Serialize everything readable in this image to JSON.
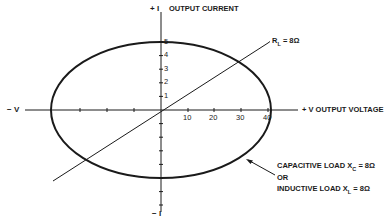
{
  "diagram": {
    "type": "load-line-ellipse",
    "colors": {
      "ink": "#1a1a1a",
      "background": "#ffffff"
    },
    "axes": {
      "y_top_label": "+ I",
      "y_bottom_label": "− I",
      "y_title": "OUTPUT CURRENT",
      "x_left_label": "− V",
      "x_right_label": "+ V",
      "x_title": "OUTPUT VOLTAGE",
      "y_ticks": [
        "1",
        "2",
        "3",
        "4",
        "5"
      ],
      "x_ticks": [
        "10",
        "20",
        "30",
        "40"
      ]
    },
    "resistive_line": {
      "label_main": "R",
      "label_sub": "L",
      "label_value": "= 8Ω"
    },
    "ellipse_annotation": {
      "line1_main": "CAPACITIVE LOAD X",
      "line1_sub": "C",
      "line1_value": "= 8Ω",
      "line2": "OR",
      "line3_main": "INDUCTIVE LOAD X",
      "line3_sub": "L",
      "line3_value": "= 8Ω"
    }
  }
}
